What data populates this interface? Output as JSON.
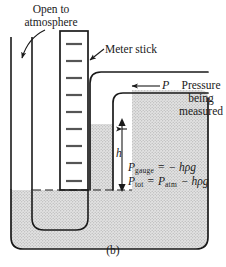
{
  "figure": {
    "caption": "(b)",
    "type": "open-tube-manometer-diagram",
    "background_color": "#ffffff",
    "line_color": "#1a1a1a",
    "liquid_fill_color": "#d9d9d9"
  },
  "labels": {
    "open_to_atmosphere": "Open to\natmosphere",
    "meter_stick": "Meter stick",
    "pressure_being_measured": "Pressure\nbeing\nmeasured",
    "pressure_symbol": "P",
    "height_symbol": "h"
  },
  "equations": {
    "gauge": {
      "lhs_symbol": "P",
      "lhs_subscript": "gauge",
      "relation": "=",
      "rhs": "− hρg",
      "plain": "P_gauge = − hρg"
    },
    "total": {
      "lhs_symbol": "P",
      "lhs_subscript": "tot",
      "relation": "=",
      "rhs_symbol": "P",
      "rhs_subscript": "atm",
      "rhs_tail": "− hρg",
      "plain": "P_tot = P_atm − hρg"
    }
  },
  "meter_stick": {
    "tick_count": 9,
    "name": "meter-stick-scale"
  },
  "annotations": {
    "arrow_atmosphere": "arrow pointing down into open left tube",
    "arrow_meter_stick": "leader arrow pointing to meter stick",
    "arrow_pressure": "arrow pointing left into right tube",
    "arrow_height": "double-headed vertical arrow spanning h"
  }
}
